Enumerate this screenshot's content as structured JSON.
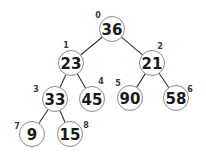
{
  "diagram": {
    "type": "binary-tree",
    "nodes": [
      {
        "index": "0",
        "value": "36"
      },
      {
        "index": "1",
        "value": "23"
      },
      {
        "index": "2",
        "value": "21"
      },
      {
        "index": "3",
        "value": "33"
      },
      {
        "index": "4",
        "value": "45"
      },
      {
        "index": "5",
        "value": "90"
      },
      {
        "index": "6",
        "value": "58"
      },
      {
        "index": "7",
        "value": "9"
      },
      {
        "index": "8",
        "value": "15"
      }
    ],
    "edges": [
      {
        "from": 0,
        "to": 1
      },
      {
        "from": 0,
        "to": 2
      },
      {
        "from": 1,
        "to": 3
      },
      {
        "from": 1,
        "to": 4
      },
      {
        "from": 2,
        "to": 5
      },
      {
        "from": 2,
        "to": 6
      },
      {
        "from": 3,
        "to": 7
      },
      {
        "from": 3,
        "to": 8
      }
    ]
  }
}
